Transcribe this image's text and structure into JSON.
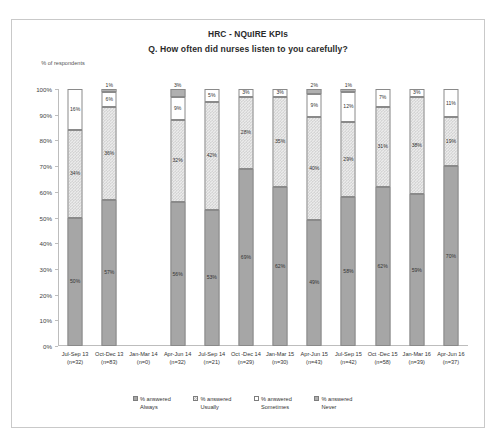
{
  "chart_data": {
    "type": "bar",
    "subtype": "100% stacked column",
    "title": "HRC - NQuIRE KPIs",
    "subtitle": "Q. How often did nurses listen to you carefully?",
    "ylabel": "% of respondents",
    "xlabel": "",
    "ylim": [
      0,
      100
    ],
    "ytick_labels": [
      "0%",
      "10%",
      "20%",
      "30%",
      "40%",
      "50%",
      "60%",
      "70%",
      "80%",
      "90%",
      "100%"
    ],
    "ytick_values": [
      0,
      10,
      20,
      30,
      40,
      50,
      60,
      70,
      80,
      90,
      100
    ],
    "grid": false,
    "legend_position": "bottom",
    "categories": [
      "Jul-Sep 13",
      "Oct-Dec 13",
      "Jan-Mar 14",
      "Apr-Jun 14",
      "Jul-Sep 14",
      "Oct -Dec 14",
      "Jan-Mar 15",
      "Apr-Jun 15",
      "Jul-Sep 15",
      "Oct -Dec 15",
      "Jan-Mar 16",
      "Apr-Jun 16"
    ],
    "category_counts": [
      "(n=32)",
      "(n=83)",
      "(n=0)",
      "(n=32)",
      "(n=21)",
      "(n=29)",
      "(n=30)",
      "(n=43)",
      "(n=42)",
      "(n=58)",
      "(n=39)",
      "(n=37)"
    ],
    "series": [
      {
        "name": "% answered Always",
        "color": "#a6a6a6",
        "values": [
          50,
          57,
          0,
          56,
          53,
          69,
          62,
          49,
          58,
          62,
          59,
          70
        ]
      },
      {
        "name": "% answered Usually",
        "color": "#ebebeb",
        "values": [
          34,
          36,
          0,
          32,
          42,
          28,
          35,
          40,
          29,
          31,
          38,
          19
        ]
      },
      {
        "name": "% answered Sometimes",
        "color": "#ffffff",
        "values": [
          16,
          6,
          0,
          9,
          5,
          3,
          3,
          9,
          12,
          7,
          3,
          11
        ]
      },
      {
        "name": "% answered Never",
        "color": "#b0b0b0",
        "values": [
          0,
          1,
          0,
          3,
          0,
          0,
          0,
          2,
          1,
          0,
          0,
          0
        ]
      }
    ],
    "bars": [
      {
        "category": "Jul-Sep 13",
        "count": "(n=32)",
        "segments": [
          {
            "series": "Always",
            "value": 50,
            "label": "50%",
            "label_position": "inside"
          },
          {
            "series": "Usually",
            "value": 34,
            "label": "34%",
            "label_position": "inside"
          },
          {
            "series": "Sometimes",
            "value": 16,
            "label": "16%",
            "label_position": "inside"
          },
          {
            "series": "Never",
            "value": 0,
            "label": "",
            "label_position": "none"
          }
        ]
      },
      {
        "category": "Oct-Dec 13",
        "count": "(n=83)",
        "segments": [
          {
            "series": "Always",
            "value": 57,
            "label": "57%",
            "label_position": "inside"
          },
          {
            "series": "Usually",
            "value": 36,
            "label": "36%",
            "label_position": "inside"
          },
          {
            "series": "Sometimes",
            "value": 6,
            "label": "6%",
            "label_position": "inside"
          },
          {
            "series": "Never",
            "value": 1,
            "label": "1%",
            "label_position": "above"
          }
        ]
      },
      {
        "category": "Jan-Mar 14",
        "count": "(n=0)",
        "segments": []
      },
      {
        "category": "Apr-Jun 14",
        "count": "(n=32)",
        "segments": [
          {
            "series": "Always",
            "value": 56,
            "label": "56%",
            "label_position": "inside"
          },
          {
            "series": "Usually",
            "value": 32,
            "label": "32%",
            "label_position": "inside"
          },
          {
            "series": "Sometimes",
            "value": 9,
            "label": "9%",
            "label_position": "inside"
          },
          {
            "series": "Never",
            "value": 3,
            "label": "3%",
            "label_position": "above"
          }
        ]
      },
      {
        "category": "Jul-Sep 14",
        "count": "(n=21)",
        "segments": [
          {
            "series": "Always",
            "value": 53,
            "label": "53%",
            "label_position": "inside"
          },
          {
            "series": "Usually",
            "value": 42,
            "label": "42%",
            "label_position": "inside"
          },
          {
            "series": "Sometimes",
            "value": 5,
            "label": "5%",
            "label_position": "inside"
          },
          {
            "series": "Never",
            "value": 0,
            "label": "",
            "label_position": "none"
          }
        ]
      },
      {
        "category": "Oct -Dec 14",
        "count": "(n=29)",
        "segments": [
          {
            "series": "Always",
            "value": 69,
            "label": "69%",
            "label_position": "inside"
          },
          {
            "series": "Usually",
            "value": 28,
            "label": "28%",
            "label_position": "inside"
          },
          {
            "series": "Sometimes",
            "value": 3,
            "label": "3%",
            "label_position": "inside"
          },
          {
            "series": "Never",
            "value": 0,
            "label": "",
            "label_position": "none"
          }
        ]
      },
      {
        "category": "Jan-Mar 15",
        "count": "(n=30)",
        "segments": [
          {
            "series": "Always",
            "value": 62,
            "label": "62%",
            "label_position": "inside"
          },
          {
            "series": "Usually",
            "value": 35,
            "label": "35%",
            "label_position": "inside"
          },
          {
            "series": "Sometimes",
            "value": 3,
            "label": "3%",
            "label_position": "inside"
          },
          {
            "series": "Never",
            "value": 0,
            "label": "",
            "label_position": "none"
          }
        ]
      },
      {
        "category": "Apr-Jun 15",
        "count": "(n=43)",
        "segments": [
          {
            "series": "Always",
            "value": 49,
            "label": "49%",
            "label_position": "inside"
          },
          {
            "series": "Usually",
            "value": 40,
            "label": "40%",
            "label_position": "inside"
          },
          {
            "series": "Sometimes",
            "value": 9,
            "label": "9%",
            "label_position": "inside"
          },
          {
            "series": "Never",
            "value": 2,
            "label": "2%",
            "label_position": "above"
          }
        ]
      },
      {
        "category": "Jul-Sep 15",
        "count": "(n=42)",
        "segments": [
          {
            "series": "Always",
            "value": 58,
            "label": "58%",
            "label_position": "inside"
          },
          {
            "series": "Usually",
            "value": 29,
            "label": "29%",
            "label_position": "inside"
          },
          {
            "series": "Sometimes",
            "value": 12,
            "label": "12%",
            "label_position": "inside"
          },
          {
            "series": "Never",
            "value": 1,
            "label": "1%",
            "label_position": "above"
          }
        ]
      },
      {
        "category": "Oct -Dec 15",
        "count": "(n=58)",
        "segments": [
          {
            "series": "Always",
            "value": 62,
            "label": "62%",
            "label_position": "inside"
          },
          {
            "series": "Usually",
            "value": 31,
            "label": "31%",
            "label_position": "inside"
          },
          {
            "series": "Sometimes",
            "value": 7,
            "label": "7%",
            "label_position": "inside"
          },
          {
            "series": "Never",
            "value": 0,
            "label": "",
            "label_position": "none"
          }
        ]
      },
      {
        "category": "Jan-Mar 16",
        "count": "(n=39)",
        "segments": [
          {
            "series": "Always",
            "value": 59,
            "label": "59%",
            "label_position": "inside"
          },
          {
            "series": "Usually",
            "value": 38,
            "label": "38%",
            "label_position": "inside"
          },
          {
            "series": "Sometimes",
            "value": 3,
            "label": "3%",
            "label_position": "inside"
          },
          {
            "series": "Never",
            "value": 0,
            "label": "",
            "label_position": "none"
          }
        ]
      },
      {
        "category": "Apr-Jun 16",
        "count": "(n=37)",
        "segments": [
          {
            "series": "Always",
            "value": 70,
            "label": "70%",
            "label_position": "inside"
          },
          {
            "series": "Usually",
            "value": 19,
            "label": "19%",
            "label_position": "inside"
          },
          {
            "series": "Sometimes",
            "value": 11,
            "label": "11%",
            "label_position": "inside"
          },
          {
            "series": "Never",
            "value": 0,
            "label": "",
            "label_position": "none"
          }
        ]
      }
    ],
    "legend": [
      {
        "label_line1": "% answered",
        "label_line2": "Always",
        "color": "#a6a6a6"
      },
      {
        "label_line1": "% answered",
        "label_line2": "Usually",
        "color": "#ebebeb"
      },
      {
        "label_line1": "% answered",
        "label_line2": "Sometimes",
        "color": "#ffffff"
      },
      {
        "label_line1": "% answered",
        "label_line2": "Never",
        "color": "#b0b0b0"
      }
    ]
  }
}
